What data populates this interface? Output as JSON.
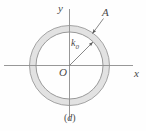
{
  "figure": {
    "caption": "(d)",
    "caption_letter": "d",
    "axes": {
      "x_label": "x",
      "y_label": "y",
      "origin_label": "O",
      "x_axis_name": "horizontal-axis",
      "y_axis_name": "vertical-axis"
    },
    "annotations": [
      {
        "id": "area-label",
        "label": "A",
        "meaning": "annular-region-A",
        "text_x": 105,
        "text_y": 13,
        "arrow_from_x": 103,
        "arrow_from_y": 17,
        "arrow_to_x": 92,
        "arrow_to_y": 33
      },
      {
        "id": "radius-label",
        "label": "k",
        "subscript": "0",
        "meaning": "inner-radius-k0",
        "text_x": 72,
        "text_y": 44,
        "arrow_from_x": 69.5,
        "arrow_from_y": 65.5,
        "arrow_to_x": 93.5,
        "arrow_to_y": 41.5
      }
    ],
    "shapes": {
      "annulus": {
        "name": "annulus-ring",
        "center_x": 69.5,
        "center_y": 65.5,
        "outer_radius": 40.0,
        "inner_radius": 33.5,
        "fill": "#e2e2e2",
        "stroke": "#9a9a9a"
      }
    },
    "colors": {
      "axis": "#8c8c8c",
      "ink": "#4a4a4a",
      "ring_fill": "#e2e2e2",
      "ring_stroke": "#9a9a9a",
      "background": "#fefefe"
    },
    "geometry": {
      "width": 146,
      "height": 131,
      "x_axis_y": 65.5,
      "y_axis_x": 69.5,
      "x_axis_start": 4,
      "x_axis_end": 133,
      "y_axis_start": 9,
      "y_axis_end": 120
    }
  }
}
